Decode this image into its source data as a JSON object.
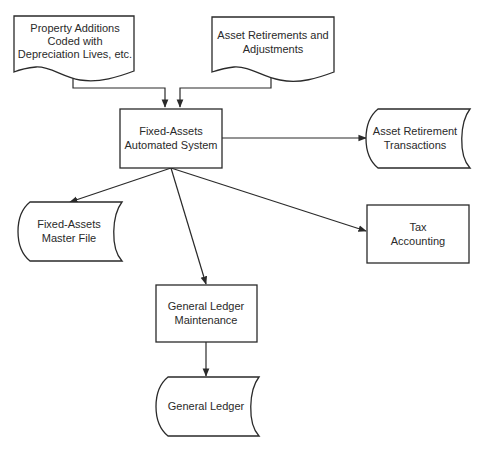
{
  "diagram": {
    "type": "flowchart",
    "colors": {
      "stroke": "#2a2a2a",
      "background": "#ffffff",
      "text": "#2a2a2a"
    },
    "nodes": [
      {
        "id": "property_additions",
        "shape": "document",
        "lines": [
          "Property Additions",
          "Coded with",
          "Depreciation Lives, etc."
        ]
      },
      {
        "id": "asset_retirements",
        "shape": "document",
        "lines": [
          "Asset Retirements and",
          "Adjustments"
        ]
      },
      {
        "id": "fixed_assets_system",
        "shape": "process",
        "lines": [
          "Fixed-Assets",
          "Automated System"
        ]
      },
      {
        "id": "asset_retirement_transactions",
        "shape": "stored-data",
        "lines": [
          "Asset Retirement",
          "Transactions"
        ]
      },
      {
        "id": "fixed_assets_master_file",
        "shape": "stored-data",
        "lines": [
          "Fixed-Assets",
          "Master File"
        ]
      },
      {
        "id": "tax_accounting",
        "shape": "process",
        "lines": [
          "Tax",
          "Accounting"
        ]
      },
      {
        "id": "gl_maintenance",
        "shape": "process",
        "lines": [
          "General Ledger",
          "Maintenance"
        ]
      },
      {
        "id": "general_ledger",
        "shape": "stored-data",
        "lines": [
          "General Ledger"
        ]
      }
    ],
    "edges": [
      {
        "from": "property_additions",
        "to": "fixed_assets_system"
      },
      {
        "from": "asset_retirements",
        "to": "fixed_assets_system"
      },
      {
        "from": "fixed_assets_system",
        "to": "asset_retirement_transactions"
      },
      {
        "from": "fixed_assets_system",
        "to": "fixed_assets_master_file"
      },
      {
        "from": "fixed_assets_system",
        "to": "tax_accounting"
      },
      {
        "from": "fixed_assets_system",
        "to": "gl_maintenance"
      },
      {
        "from": "gl_maintenance",
        "to": "general_ledger"
      }
    ]
  }
}
